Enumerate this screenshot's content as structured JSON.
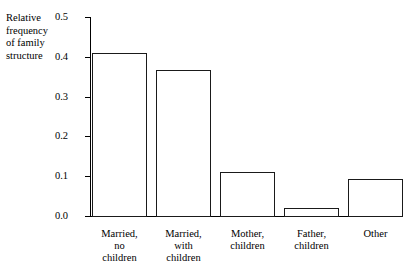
{
  "chart_data": {
    "type": "bar",
    "title": "",
    "subtitle": "",
    "xlabel": "",
    "ylabel": "Relative frequency of family structure",
    "ylabel_lines": "Relative\nfrequency\nof family\nstructure",
    "categories": [
      "Married, no children",
      "Married, with children",
      "Mother, children",
      "Father, children",
      "Other"
    ],
    "category_lines": [
      "Married,\nno\nchildren",
      "Married,\nwith\nchildren",
      "Mother,\nchildren",
      "Father,\nchildren",
      "Other"
    ],
    "values": [
      0.41,
      0.367,
      0.111,
      0.021,
      0.094
    ],
    "ylim": [
      0.0,
      0.5
    ],
    "ytick_values": [
      0.0,
      0.1,
      0.2,
      0.3,
      0.4,
      0.5
    ],
    "ytick_labels": [
      "0.0",
      "0.1",
      "0.2",
      "0.3",
      "0.4",
      "0.5"
    ],
    "grid": false,
    "legend": false,
    "legend_position": "none",
    "bar_fill_color": "#ffffff",
    "bar_edge_color": "#1a1a1a",
    "background_color": "#ffffff",
    "axis_color": "#000000"
  }
}
